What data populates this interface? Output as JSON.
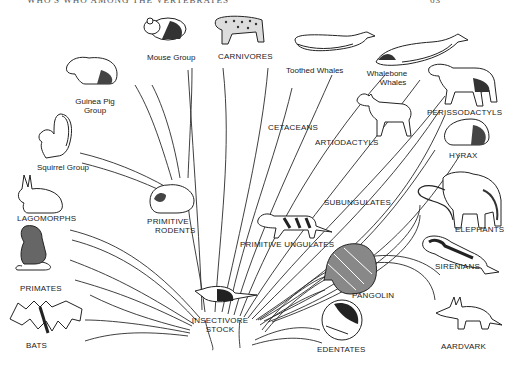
{
  "header": {
    "title": "WHO'S WHO AMONG THE VERTEBRATES",
    "page_number": "63"
  },
  "diagram": {
    "type": "evolutionary-tree",
    "root": "INSECTIVORE STOCK",
    "labels": {
      "mouse_group": "Mouse Group",
      "carnivores": "CARNIVORES",
      "toothed_whales": "Toothed Whales",
      "whalebone_whales_1": "Whalebone",
      "whalebone_whales_2": "Whales",
      "guinea_pig_1": "Guinea Pig",
      "guinea_pig_2": "Group",
      "perissodactyls": "PERISSODACTYLS",
      "cetaceans": "CETACEANS",
      "artiodactyls": "ARTIODACTYLS",
      "hyrax": "HYRAX",
      "squirrel_group": "Squirrel Group",
      "subungulates": "SUBUNGULATES",
      "lagomorphs": "LAGOMORPHS",
      "primitive_rodents_1": "PRIMITIVE",
      "primitive_rodents_2": "RODENTS",
      "elephants": "ELEPHANTS",
      "primitive_ungulates": "PRIMITIVE UNGULATES",
      "sirenians": "SIRENIANS",
      "primates": "PRIMATES",
      "pangolin": "PANGOLIN",
      "insectivore_1": "INSECTIVORE",
      "insectivore_2": "STOCK",
      "bats": "BATS",
      "edentates": "EDENTATES",
      "aardvark": "AARDVARK"
    },
    "edges": [
      [
        "INSECTIVORE STOCK",
        "PRIMITIVE RODENTS"
      ],
      [
        "PRIMITIVE RODENTS",
        "Mouse Group"
      ],
      [
        "PRIMITIVE RODENTS",
        "Guinea Pig Group"
      ],
      [
        "PRIMITIVE RODENTS",
        "Squirrel Group"
      ],
      [
        "INSECTIVORE STOCK",
        "CARNIVORES"
      ],
      [
        "INSECTIVORE STOCK",
        "CETACEANS"
      ],
      [
        "CETACEANS",
        "Toothed Whales"
      ],
      [
        "CETACEANS",
        "Whalebone Whales"
      ],
      [
        "INSECTIVORE STOCK",
        "PRIMITIVE UNGULATES"
      ],
      [
        "PRIMITIVE UNGULATES",
        "ARTIODACTYLS"
      ],
      [
        "PRIMITIVE UNGULATES",
        "PERISSODACTYLS"
      ],
      [
        "PRIMITIVE UNGULATES",
        "SUBUNGULATES"
      ],
      [
        "SUBUNGULATES",
        "HYRAX"
      ],
      [
        "SUBUNGULATES",
        "ELEPHANTS"
      ],
      [
        "SUBUNGULATES",
        "SIRENIANS"
      ],
      [
        "INSECTIVORE STOCK",
        "LAGOMORPHS"
      ],
      [
        "INSECTIVORE STOCK",
        "PRIMATES"
      ],
      [
        "INSECTIVORE STOCK",
        "BATS"
      ],
      [
        "INSECTIVORE STOCK",
        "PANGOLIN"
      ],
      [
        "INSECTIVORE STOCK",
        "EDENTATES"
      ],
      [
        "INSECTIVORE STOCK",
        "AARDVARK"
      ]
    ]
  }
}
